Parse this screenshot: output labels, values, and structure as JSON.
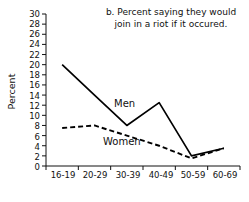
{
  "chart_data": {
    "type": "line",
    "title": "b. Percent saying they would join in a riot if it occured.",
    "title_line1": "b. Percent saying they would",
    "title_line2": "join in a riot if it occured.",
    "xlabel": "Age groups",
    "ylabel": "Percent",
    "categories": [
      "16-19",
      "20-29",
      "30-39",
      "40-49",
      "50-59",
      "60-69"
    ],
    "ylim": [
      0,
      30
    ],
    "ytick_step": 2,
    "yticks": [
      0,
      2,
      4,
      6,
      8,
      10,
      12,
      14,
      16,
      18,
      20,
      22,
      24,
      26,
      28,
      30
    ],
    "grid": false,
    "legend_position": "inline",
    "series": [
      {
        "name": "Men",
        "style": "solid",
        "color": "#000000",
        "values": [
          20,
          14,
          8,
          12.5,
          2,
          3.5
        ]
      },
      {
        "name": "Women",
        "style": "dashed",
        "color": "#000000",
        "values": [
          7.5,
          8,
          6,
          4,
          1.5,
          3.5
        ]
      }
    ]
  },
  "axis": {
    "ytick_labels": [
      "30",
      "28",
      "26",
      "24",
      "22",
      "20",
      "18",
      "16",
      "14",
      "12",
      "10",
      "8",
      "6",
      "4",
      "2",
      "0"
    ],
    "xtick_labels": [
      "16-19",
      "20-29",
      "30-39",
      "40-49",
      "50-59",
      "60-69"
    ]
  },
  "colors": {
    "background": "#ffffff",
    "ink": "#111111",
    "line": "#000000"
  }
}
